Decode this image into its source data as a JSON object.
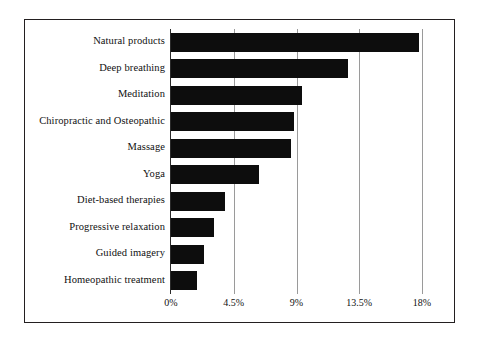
{
  "chart_data": {
    "type": "bar",
    "orientation": "horizontal",
    "title": "",
    "subtitle": "",
    "xlabel": "",
    "ylabel": "",
    "categories": [
      "Natural products",
      "Deep breathing",
      "Meditation",
      "Chiropractic and Osteopathic",
      "Massage",
      "Yoga",
      "Diet-based therapies",
      "Progressive relaxation",
      "Guided imagery",
      "Homeopathic treatment"
    ],
    "values": [
      17.8,
      12.7,
      9.4,
      8.8,
      8.6,
      6.3,
      3.9,
      3.1,
      2.4,
      1.9
    ],
    "value_unit": "%",
    "xlim": [
      0,
      18
    ],
    "xticks": [
      0,
      4.5,
      9,
      13.5,
      18
    ],
    "xtick_labels": [
      "0%",
      "4.5%",
      "9%",
      "13.5%",
      "18%"
    ],
    "grid": "vertical",
    "legend": "none",
    "bar_color": "#0d0d0d",
    "gridline_color": "#9a9a9a",
    "axis_color": "#2a2a2a",
    "frame_color": "#231f20",
    "background": "#ffffff"
  }
}
